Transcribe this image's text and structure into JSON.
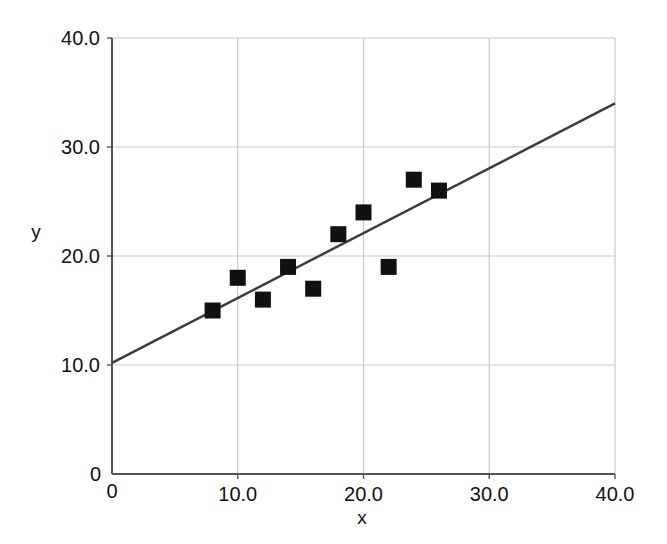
{
  "chart_data": {
    "type": "scatter",
    "title": "",
    "xlabel": "x",
    "ylabel": "y",
    "xlim": [
      0,
      40
    ],
    "ylim": [
      0,
      40
    ],
    "grid": true,
    "legend": null,
    "x_ticks": [
      "0",
      "10.0",
      "20.0",
      "30.0",
      "40.0"
    ],
    "x_tick_values": [
      0,
      10,
      20,
      30,
      40
    ],
    "y_ticks": [
      "0",
      "10.0",
      "20.0",
      "30.0",
      "40.0"
    ],
    "y_tick_values": [
      0,
      10,
      20,
      30,
      40
    ],
    "origin_label": "0",
    "series": [
      {
        "name": "data points",
        "marker": "square",
        "color": "#111111",
        "points": [
          {
            "x": 8,
            "y": 15
          },
          {
            "x": 10,
            "y": 18
          },
          {
            "x": 12,
            "y": 16
          },
          {
            "x": 14,
            "y": 19
          },
          {
            "x": 16,
            "y": 17
          },
          {
            "x": 18,
            "y": 22
          },
          {
            "x": 20,
            "y": 24
          },
          {
            "x": 22,
            "y": 19
          },
          {
            "x": 24,
            "y": 27
          },
          {
            "x": 26,
            "y": 26
          }
        ]
      },
      {
        "name": "trend line",
        "marker": "line",
        "color": "#3b3b3b",
        "line": {
          "x1": 0,
          "y1": 10.2,
          "x2": 40,
          "y2": 34.0
        }
      }
    ],
    "colors": {
      "marker": "#111111",
      "trend_line": "#3b3b3b",
      "grid": "#c9c9c9",
      "axis": "#555555",
      "background": "#ffffff"
    }
  }
}
